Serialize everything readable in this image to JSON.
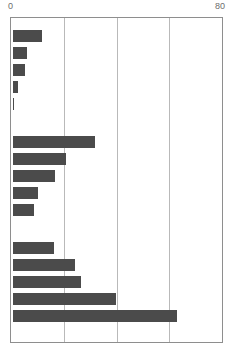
{
  "chart_data": {
    "type": "bar",
    "orientation": "horizontal",
    "title": "",
    "subtitle": "",
    "xlabel": "",
    "ylabel": "",
    "xlim": [
      0,
      80
    ],
    "axis_tick_labels": [
      "0",
      "80"
    ],
    "axis_ticks": [
      0,
      80
    ],
    "gridlines": [
      20,
      40,
      60
    ],
    "grid": true,
    "legend": null,
    "legend_position": "none",
    "categories": [
      "bar-1",
      "bar-2",
      "bar-3",
      "bar-4",
      "bar-5",
      "bar-6",
      "bar-7",
      "bar-8",
      "bar-9",
      "bar-10",
      "bar-11",
      "bar-12",
      "bar-13",
      "bar-14",
      "bar-15"
    ],
    "values": [
      11.0,
      5.3,
      4.5,
      1.9,
      0.4,
      31.0,
      20.0,
      16.0,
      9.4,
      7.9,
      15.5,
      23.4,
      25.7,
      38.9,
      62.3
    ],
    "groups": [
      {
        "name": "group-1",
        "indices": [
          0,
          1,
          2,
          3,
          4
        ]
      },
      {
        "name": "group-2",
        "indices": [
          5,
          6,
          7,
          8,
          9
        ]
      },
      {
        "name": "group-3",
        "indices": [
          10,
          11,
          12,
          13,
          14
        ]
      }
    ],
    "bar_color": "#4b4b4b",
    "grid_color": "#b9b9b9",
    "frame_color": "#8e8e8e",
    "label_color": "#6d6d6d",
    "background": "#ffffff"
  }
}
